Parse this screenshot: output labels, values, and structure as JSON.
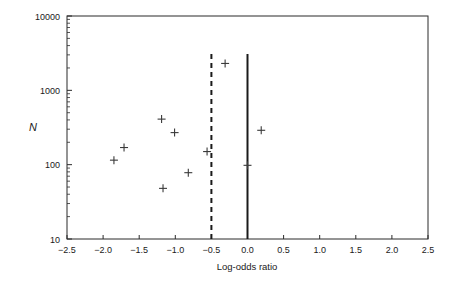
{
  "chart_data": {
    "type": "scatter",
    "title": "",
    "xlabel": "Log-odds ratio",
    "ylabel": "N",
    "xlim": [
      -2.5,
      2.5
    ],
    "ylim": [
      10,
      10000
    ],
    "yscale": "log",
    "xscale": "linear",
    "grid": false,
    "legend": null,
    "xticklabels": [
      "-2.5",
      "-2.0",
      "-1.5",
      "-1.0",
      "-0.5",
      "0.0",
      "0.5",
      "1.0",
      "1.5",
      "2.0",
      "2.5"
    ],
    "xtickvalues": [
      -2.5,
      -2.0,
      -1.5,
      -1.0,
      -0.5,
      0.0,
      0.5,
      1.0,
      1.5,
      2.0,
      2.5
    ],
    "yticklabels": [
      "10",
      "100",
      "1000",
      "10000"
    ],
    "ytickvalues": [
      10,
      100,
      1000,
      10000
    ],
    "marker_symbol": "plus",
    "points": [
      {
        "x": -1.85,
        "y": 115
      },
      {
        "x": -1.71,
        "y": 170
      },
      {
        "x": -1.19,
        "y": 410
      },
      {
        "x": -1.17,
        "y": 48
      },
      {
        "x": -1.01,
        "y": 270
      },
      {
        "x": -0.82,
        "y": 78
      },
      {
        "x": -0.56,
        "y": 150
      },
      {
        "x": -0.31,
        "y": 2300
      },
      {
        "x": 0.0,
        "y": 98
      },
      {
        "x": 0.19,
        "y": 290
      }
    ],
    "reference_lines": [
      {
        "name": "pooled-estimate",
        "x": -0.5,
        "style": "dashed"
      },
      {
        "name": "null-effect",
        "x": 0.0,
        "style": "solid"
      }
    ],
    "colors": {
      "axis": "#2b2b2b",
      "marker": "#3a3a3a",
      "reference": "#1a1a1a",
      "background": "#ffffff"
    }
  }
}
